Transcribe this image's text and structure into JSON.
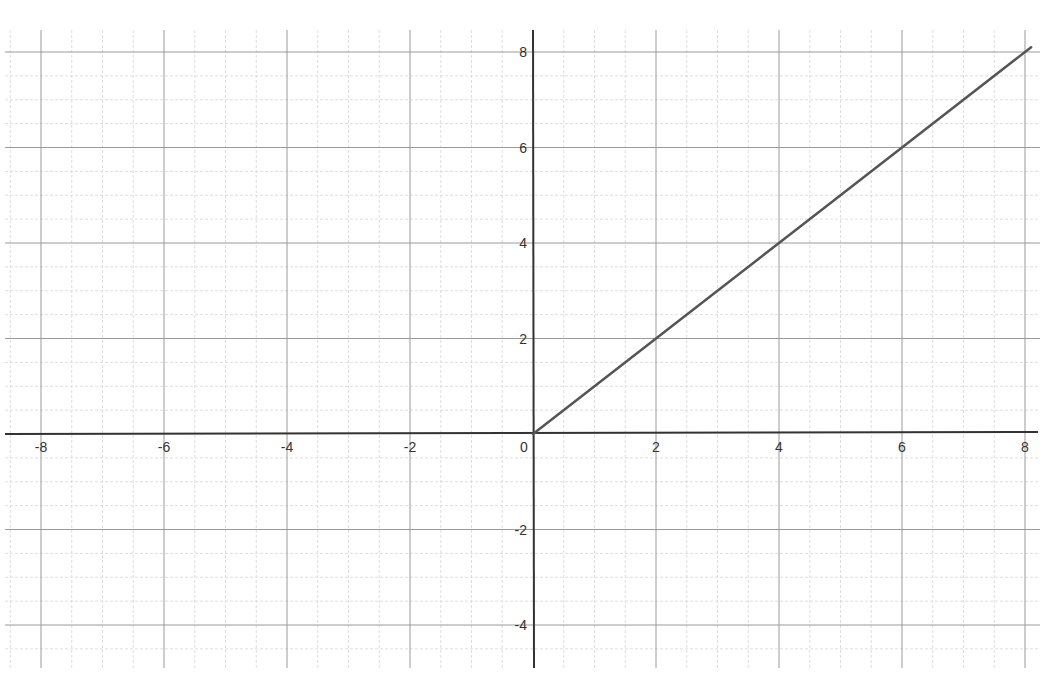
{
  "chart_data": {
    "type": "line",
    "title": "",
    "xlabel": "",
    "ylabel": "",
    "xlim": [
      -8.6,
      8.2
    ],
    "ylim": [
      -5.0,
      8.4
    ],
    "grid": true,
    "grid_major_step": 2,
    "grid_minor_step": 0.5,
    "x_ticks": [
      -8,
      -6,
      -4,
      -2,
      0,
      2,
      4,
      6,
      8
    ],
    "x_tick_labels": [
      "-8",
      "-6",
      "-4",
      "-2",
      "0",
      "2",
      "4",
      "6",
      "8"
    ],
    "y_ticks": [
      -4,
      -2,
      2,
      4,
      6,
      8
    ],
    "y_tick_labels": [
      "-4",
      "-2",
      "2",
      "4",
      "6",
      "8"
    ],
    "origin_label": "0",
    "series": [
      {
        "name": "f(x) = max(0, x)",
        "color": "#555555",
        "x": [
          0,
          2,
          4,
          6,
          8.1
        ],
        "y": [
          0,
          2,
          4,
          6,
          8.1
        ]
      }
    ],
    "legend": null
  },
  "colors": {
    "axis": "#333333",
    "major_grid": "#9a9a9a",
    "minor_grid": "#dedede",
    "curve": "#555555",
    "background": "#ffffff"
  }
}
